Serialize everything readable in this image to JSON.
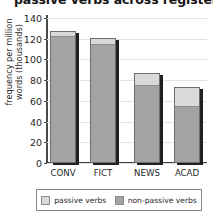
{
  "chart_data": {
    "type": "bar",
    "subtype": "stacked-bar",
    "title": "passive verbs across registers",
    "xlabel": "",
    "ylabel": "frequency per million words (thousands)",
    "categories": [
      "CONV",
      "FICT",
      "NEWS",
      "ACAD"
    ],
    "yticks": [
      0,
      20,
      40,
      60,
      80,
      100,
      120,
      140
    ],
    "ylim": [
      0,
      140
    ],
    "grid": true,
    "legend_position": "bottom",
    "series": [
      {
        "name": "non-passive verbs",
        "color": "#a3a3a3",
        "values": [
          123,
          115,
          75,
          55
        ]
      },
      {
        "name": "passive verbs",
        "color": "#d9d9d9",
        "values": [
          4,
          6,
          12,
          18
        ]
      }
    ],
    "totals": [
      127,
      121,
      87,
      73
    ]
  },
  "legend": {
    "items": [
      {
        "label": "passive verbs",
        "color": "#d9d9d9"
      },
      {
        "label": "non-passive verbs",
        "color": "#a3a3a3"
      }
    ]
  },
  "axis": {
    "y_label_line1": "frequency per million",
    "y_label_line2": "words (thousands)"
  }
}
